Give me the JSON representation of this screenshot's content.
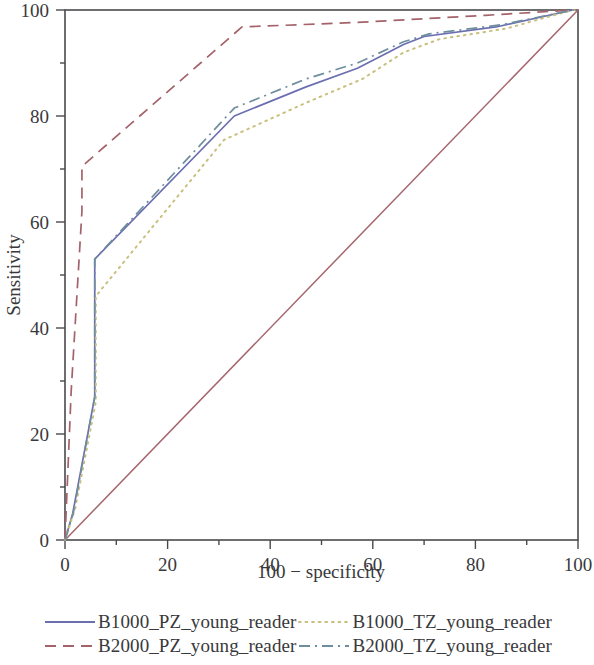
{
  "chart_data": {
    "type": "line",
    "title": "",
    "xlabel": "100 − specificity",
    "ylabel": "Sensitivity",
    "xlim": [
      0,
      100
    ],
    "ylim": [
      0,
      100
    ],
    "xticks": [
      0,
      20,
      40,
      60,
      80,
      100
    ],
    "yticks": [
      0,
      20,
      40,
      60,
      80,
      100
    ],
    "xtick_labels": [
      "0",
      "20",
      "40",
      "60",
      "80",
      "100"
    ],
    "ytick_labels": [
      "0",
      "20",
      "40",
      "60",
      "80",
      "100"
    ],
    "minor_tick_step": 10,
    "grid": false,
    "legend_position": "below",
    "series": [
      {
        "name": "B1000_PZ_young_reader",
        "color": "#6b6fb0",
        "dash": "solid",
        "x": [
          0,
          1.5,
          5.8,
          5.8,
          33,
          47,
          57,
          66,
          70,
          84,
          99,
          100
        ],
        "y": [
          0,
          5,
          27,
          53,
          80,
          85.5,
          89,
          93.5,
          95,
          96.8,
          100,
          100
        ]
      },
      {
        "name": "B2000_PZ_young_reader",
        "color": "#a4636a",
        "dash": "dashed",
        "x": [
          0,
          1.2,
          3.3,
          3.3,
          34.5,
          58,
          82,
          99,
          100
        ],
        "y": [
          0,
          28,
          62,
          70.5,
          96.8,
          97.7,
          99,
          100,
          100
        ]
      },
      {
        "name": "B1000_TZ_young_reader",
        "color": "#c9bf7e",
        "dash": "dotted",
        "x": [
          0,
          2,
          6,
          6,
          31,
          47,
          58,
          66,
          73,
          86,
          99,
          100
        ],
        "y": [
          0,
          6,
          26,
          46,
          75.5,
          82.5,
          87,
          92,
          94.5,
          96.5,
          100,
          100
        ]
      },
      {
        "name": "B2000_TZ_young_reader",
        "color": "#6e8e9e",
        "dash": "dashdot",
        "x": [
          0,
          1.6,
          5.8,
          5.8,
          33,
          47,
          57,
          66,
          71,
          85,
          99,
          100
        ],
        "y": [
          0,
          5,
          27,
          53,
          81.5,
          87,
          90,
          94,
          95.5,
          97.2,
          100,
          100
        ]
      }
    ],
    "reference_line": {
      "name": "chance-diagonal",
      "color": "#a5656d",
      "dash": "solid",
      "x": [
        0,
        100
      ],
      "y": [
        0,
        100
      ]
    }
  },
  "legend": {
    "entries": [
      {
        "label": "B1000_PZ_young_reader",
        "style": "solid",
        "color": "#6b6fb0"
      },
      {
        "label": "B1000_TZ_young_reader",
        "style": "dotted",
        "color": "#c9bf7e"
      },
      {
        "label": "B2000_PZ_young_reader",
        "style": "dashed",
        "color": "#a4636a"
      },
      {
        "label": "B2000_TZ_young_reader",
        "style": "dashdot",
        "color": "#6e8e9e"
      }
    ]
  }
}
